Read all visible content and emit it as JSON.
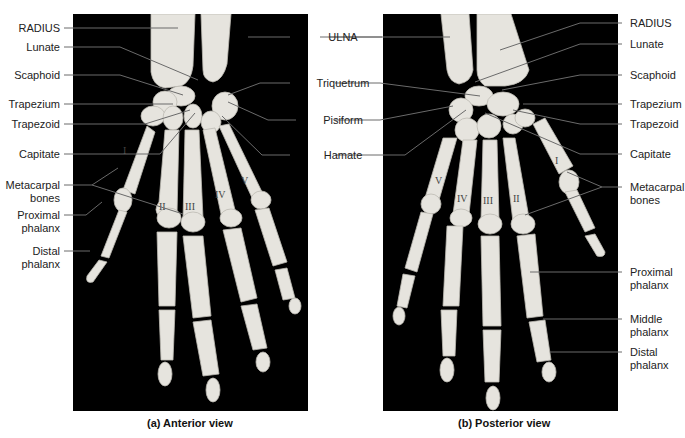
{
  "figure": {
    "panel_a": {
      "caption": "(a) Anterior view",
      "numerals": [
        "I",
        "II",
        "III",
        "IV",
        "V"
      ]
    },
    "panel_b": {
      "caption": "(b) Posterior view",
      "numerals": [
        "V",
        "IV",
        "III",
        "II",
        "I"
      ]
    },
    "left_labels": [
      {
        "text": "RADIUS"
      },
      {
        "text": "Lunate"
      },
      {
        "text": "Scaphoid"
      },
      {
        "text": "Trapezium"
      },
      {
        "text": "Trapezoid"
      },
      {
        "text": "Capitate"
      },
      {
        "text": "Metacarpal\nbones",
        "line1": "Metacarpal",
        "line2": "bones"
      },
      {
        "line1": "Proximal",
        "line2": "phalanx"
      },
      {
        "line1": "Distal",
        "line2": "phalanx"
      }
    ],
    "center_labels": [
      {
        "text": "ULNA"
      },
      {
        "text": "Triquetrum"
      },
      {
        "text": "Pisiform"
      },
      {
        "text": "Hamate"
      }
    ],
    "right_labels": [
      {
        "text": "RADIUS"
      },
      {
        "text": "Lunate"
      },
      {
        "text": "Scaphoid"
      },
      {
        "text": "Trapezium"
      },
      {
        "text": "Trapezoid"
      },
      {
        "text": "Capitate"
      },
      {
        "line1": "Metacarpal",
        "line2": "bones"
      },
      {
        "line1": "Proximal",
        "line2": "phalanx"
      },
      {
        "line1": "Middle",
        "line2": "phalanx"
      },
      {
        "line1": "Distal",
        "line2": "phalanx"
      }
    ],
    "colors": {
      "background": "#ffffff",
      "photo_background": "#000000",
      "bone": "#e8e6e0",
      "leader_line": "#666666",
      "text": "#222222"
    }
  }
}
